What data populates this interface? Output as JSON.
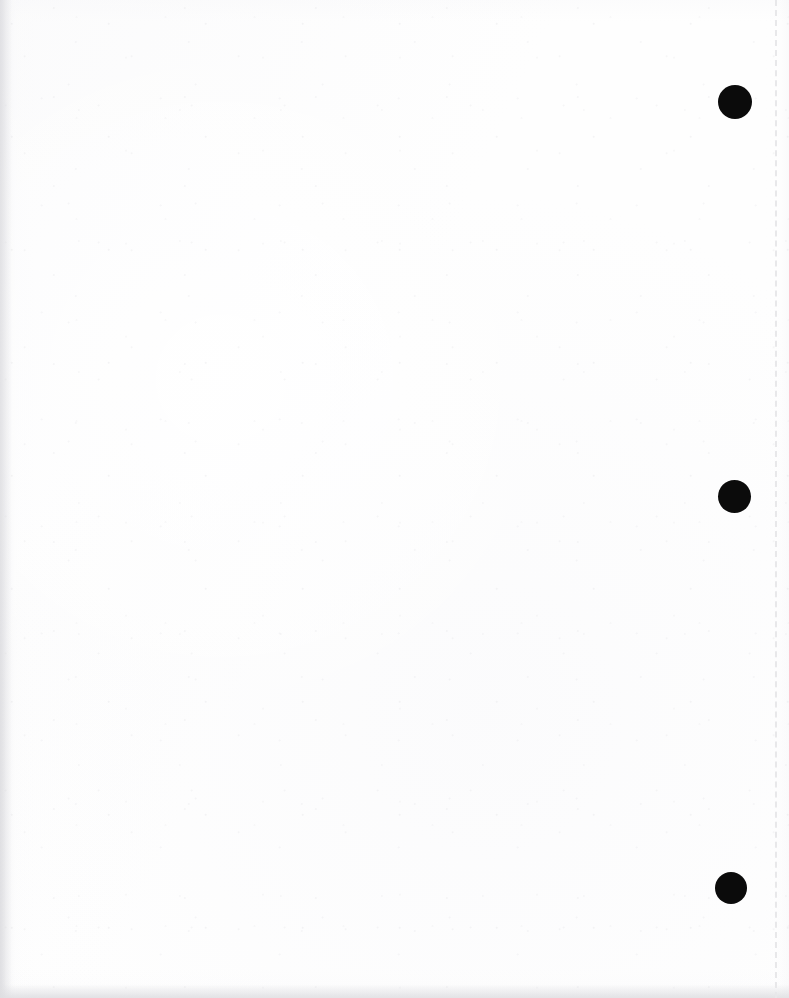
{
  "page": {
    "width": 789,
    "height": 998,
    "background_color": "#fefefe",
    "paper_tone": "#ffffff",
    "content_text": ""
  },
  "perforation": {
    "name": "dashed-tear-line",
    "orientation": "vertical",
    "x": 775,
    "color": "#e8e8ea",
    "dash_length": 8,
    "dash_gap": 9,
    "thickness": 2
  },
  "marks": {
    "color": "#0b0b0b",
    "count": 3,
    "items": [
      {
        "label": "binding-mark-top",
        "x": 735,
        "y": 102,
        "diameter": 34
      },
      {
        "label": "binding-mark-middle",
        "x": 734,
        "y": 496,
        "diameter": 33
      },
      {
        "label": "binding-mark-bottom",
        "x": 731,
        "y": 888,
        "diameter": 32
      }
    ]
  },
  "edges": {
    "left_shadow_color": "#dbdbdf",
    "bottom_shadow_color": "#dfdfe2"
  }
}
